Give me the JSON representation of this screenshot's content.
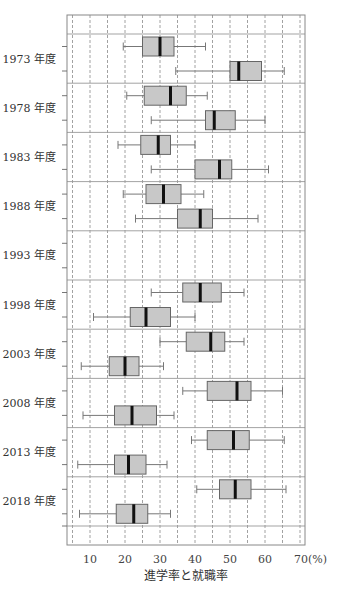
{
  "chart_data": {
    "type": "boxplot",
    "orientation": "horizontal",
    "title": "",
    "xlabel": "進学率と就職率",
    "x_unit": "(%)",
    "xlim": [
      3.4,
      71.4
    ],
    "x_ticks": [
      10,
      20,
      30,
      40,
      50,
      60,
      70
    ],
    "x_tick_labels": [
      "10",
      "20",
      "30",
      "40",
      "50",
      "60",
      "70(%)"
    ],
    "grid": {
      "vertical_dashed_every": 5,
      "from": 5,
      "to": 70
    },
    "box_color": "#c8c8c8",
    "median_color": "#111111",
    "series_note": "Two boxes per year: 進学率 (advancement rate) and 就職率 (employment rate). Top box is 進学率 until 1988; from 1998 onward the top box is 就職率.",
    "categories": [
      "1973 年度",
      "1978 年度",
      "1983 年度",
      "1988 年度",
      "1993 年度",
      "1998 年度",
      "2003 年度",
      "2008 年度",
      "2013 年度",
      "2018 年度"
    ],
    "groups": [
      {
        "label": "1973 年度",
        "boxes": [
          {
            "position": "top",
            "series": "進学率",
            "min": 19.5,
            "q1": 25,
            "median": 30,
            "q3": 34,
            "max": 43
          },
          {
            "position": "bottom",
            "series": "就職率",
            "min": 34.5,
            "q1": 50,
            "median": 52.5,
            "q3": 59,
            "max": 65.5
          }
        ]
      },
      {
        "label": "1978 年度",
        "boxes": [
          {
            "position": "top",
            "series": "進学率",
            "min": 20.5,
            "q1": 25.5,
            "median": 33,
            "q3": 37.5,
            "max": 43.5
          },
          {
            "position": "bottom",
            "series": "就職率",
            "min": 27.5,
            "q1": 43,
            "median": 45.5,
            "q3": 51.5,
            "max": 60
          }
        ]
      },
      {
        "label": "1983 年度",
        "boxes": [
          {
            "position": "top",
            "series": "進学率",
            "min": 18,
            "q1": 24.5,
            "median": 29.5,
            "q3": 33,
            "max": 40
          },
          {
            "position": "bottom",
            "series": "就職率",
            "min": 27.5,
            "q1": 40,
            "median": 47,
            "q3": 50.5,
            "max": 61
          }
        ]
      },
      {
        "label": "1988 年度",
        "boxes": [
          {
            "position": "top",
            "series": "進学率",
            "min": 19.5,
            "q1": 26,
            "median": 31,
            "q3": 36,
            "max": 42.5
          },
          {
            "position": "bottom",
            "series": "就職率",
            "min": 23,
            "q1": 35,
            "median": 41.5,
            "q3": 45,
            "max": 58
          }
        ]
      },
      {
        "label": "1993 年度",
        "boxes": []
      },
      {
        "label": "1998 年度",
        "boxes": [
          {
            "position": "top",
            "series": "就職率",
            "min": 27.5,
            "q1": 36.5,
            "median": 41.5,
            "q3": 47.5,
            "max": 54
          },
          {
            "position": "bottom",
            "series": "進学率",
            "min": 11,
            "q1": 21.5,
            "median": 26,
            "q3": 33,
            "max": 40
          }
        ]
      },
      {
        "label": "2003 年度",
        "boxes": [
          {
            "position": "top",
            "series": "就職率",
            "min": 30,
            "q1": 37.5,
            "median": 44.5,
            "q3": 48.5,
            "max": 54
          },
          {
            "position": "bottom",
            "series": "進学率",
            "min": 7.5,
            "q1": 15.5,
            "median": 20,
            "q3": 24,
            "max": 31
          }
        ]
      },
      {
        "label": "2008 年度",
        "boxes": [
          {
            "position": "top",
            "series": "就職率",
            "min": 36.5,
            "q1": 43.5,
            "median": 52,
            "q3": 56,
            "max": 65
          },
          {
            "position": "bottom",
            "series": "進学率",
            "min": 8,
            "q1": 17,
            "median": 22,
            "q3": 29,
            "max": 34
          }
        ]
      },
      {
        "label": "2013 年度",
        "boxes": [
          {
            "position": "top",
            "series": "就職率",
            "min": 39,
            "q1": 43.5,
            "median": 51,
            "q3": 55.5,
            "max": 65.5
          },
          {
            "position": "bottom",
            "series": "進学率",
            "min": 6.5,
            "q1": 17,
            "median": 21,
            "q3": 26,
            "max": 32
          }
        ]
      },
      {
        "label": "2018 年度",
        "boxes": [
          {
            "position": "top",
            "series": "就職率",
            "min": 40.5,
            "q1": 47,
            "median": 51.5,
            "q3": 56,
            "max": 66
          },
          {
            "position": "bottom",
            "series": "進学率",
            "min": 7,
            "q1": 17.5,
            "median": 22.5,
            "q3": 26.5,
            "max": 33
          }
        ]
      }
    ]
  }
}
